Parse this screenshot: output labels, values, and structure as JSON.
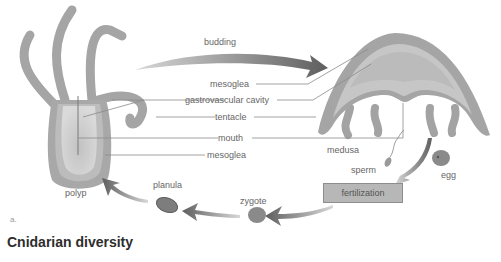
{
  "diagram": {
    "title": "Cnidarian diversity",
    "panel_label": "a.",
    "organisms": {
      "polyp": "polyp",
      "medusa": "medusa",
      "planula": "planula",
      "zygote": "zygote",
      "sperm": "sperm",
      "egg": "egg"
    },
    "process_labels": {
      "budding": "budding",
      "fertilization": "fertilization"
    },
    "anatomy_labels": [
      {
        "id": "mesoglea-top",
        "text": "mesoglea"
      },
      {
        "id": "gastrovascular-cavity",
        "text": "gastrovascular cavity"
      },
      {
        "id": "tentacle",
        "text": "tentacle"
      },
      {
        "id": "mouth",
        "text": "mouth"
      },
      {
        "id": "mesoglea-bottom",
        "text": "mesoglea"
      }
    ],
    "colors": {
      "body": "#a9a9a9",
      "body_dark": "#8f8f8f",
      "inner": "#cfcfcf",
      "arrow": "#6e6e6e",
      "line": "#8a8a8a",
      "fert_box": "#b7b7b7"
    }
  }
}
